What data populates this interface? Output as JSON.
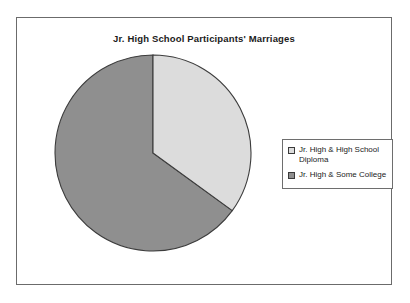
{
  "chart": {
    "title": "Jr. High School Participants' Marriages",
    "frame_border_color": "#6b6b6b",
    "background_color": "#ffffff"
  },
  "legend": {
    "border_color": "#6e6e6e",
    "position": "right",
    "items": [
      {
        "label": "Jr. High & High School\nDiploma",
        "swatch_name": "legend-swatch-diploma",
        "color": "#dcdcdc"
      },
      {
        "label": "Jr. High & Some College",
        "swatch_name": "legend-swatch-some-college",
        "color": "#8f8f8f"
      }
    ]
  },
  "chart_data": {
    "type": "pie",
    "title": "Jr. High School Participants' Marriages",
    "xlabel": "",
    "ylabel": "",
    "labels": [
      "Jr. High & High School Diploma",
      "Jr. High & Some College"
    ],
    "values": [
      35,
      65
    ],
    "units": "percent",
    "colors": [
      "#dcdcdc",
      "#8f8f8f"
    ],
    "slice_border_color": "#3c3c3c",
    "start_angle_deg": 90,
    "direction": "clockwise",
    "legend_position": "right",
    "grid": false
  }
}
